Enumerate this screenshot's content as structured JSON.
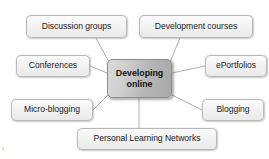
{
  "diagram": {
    "type": "radial-spoke",
    "title": "Developing online",
    "center": {
      "label": "Developing online",
      "line1": "Developing",
      "line2": "online",
      "fill_start": "#d9d9d9",
      "fill_end": "#a9a9a9",
      "border_color": "#8f8f8f",
      "text_color": "#121212"
    },
    "node_style": {
      "fill_start": "#fbfbfb",
      "fill_end": "#e9e9e9",
      "border_color": "#b9b9b9",
      "text_color": "#1b1b1b"
    },
    "connector_color": "#a5a5a5",
    "background": "#ffffff",
    "nodes": [
      {
        "id": "discussion-groups",
        "label": "Discussion groups",
        "position": "top-left"
      },
      {
        "id": "development-courses",
        "label": "Development courses",
        "position": "top-right"
      },
      {
        "id": "conferences",
        "label": "Conferences",
        "position": "middle-left"
      },
      {
        "id": "eportfolios",
        "label": "ePortfolios",
        "position": "middle-right"
      },
      {
        "id": "micro-blogging",
        "label": "Micro-blogging",
        "position": "bottom-left"
      },
      {
        "id": "blogging",
        "label": "Blogging",
        "position": "bottom-right"
      },
      {
        "id": "personal-learning-networks",
        "label": "Personal Learning Networks",
        "position": "bottom-center"
      }
    ],
    "artifact": {
      "mark": "‖"
    }
  }
}
